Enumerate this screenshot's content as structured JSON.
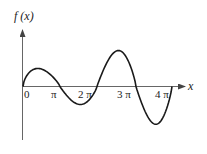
{
  "chart_data": {
    "type": "line",
    "title": "",
    "ylabel": "f (x)",
    "xlabel": "x",
    "grid": false,
    "legend": "none",
    "xticks": [
      {
        "value": 0,
        "label": "0"
      },
      {
        "value": 1,
        "label": "π"
      },
      {
        "value": 2,
        "label": "2 π"
      },
      {
        "value": 3,
        "label": "3 π"
      },
      {
        "value": 4,
        "label": "4 π"
      }
    ],
    "x_units": "π",
    "xlim": [
      0,
      4.3
    ],
    "ylim": [
      -1.4,
      1.8
    ],
    "series": [
      {
        "name": "f(x)",
        "description": "Piecewise arches: small positive hump on [0,π], small negative trough on [π,2π], tall positive hump on [2π,3π], deep negative trough on [3π,4π], then vertical line back to axis at 4π",
        "segments": [
          {
            "x_start": 0,
            "x_end": 1,
            "extremum_x": 0.4,
            "extremum_y": 0.5
          },
          {
            "x_start": 1,
            "x_end": 2,
            "extremum_x": 1.55,
            "extremum_y": -0.5
          },
          {
            "x_start": 2,
            "x_end": 3,
            "extremum_x": 2.55,
            "extremum_y": 1.0
          },
          {
            "x_start": 3,
            "x_end": 4,
            "extremum_x": 3.55,
            "extremum_y": -1.05
          }
        ]
      }
    ]
  },
  "labels": {
    "y_axis": "f (x)",
    "x_axis": "x",
    "ticks": [
      "0",
      "π",
      "2 π",
      "3 π",
      "4 π"
    ]
  },
  "colors": {
    "curve": "#1a1a1a",
    "axis": "#555555"
  }
}
